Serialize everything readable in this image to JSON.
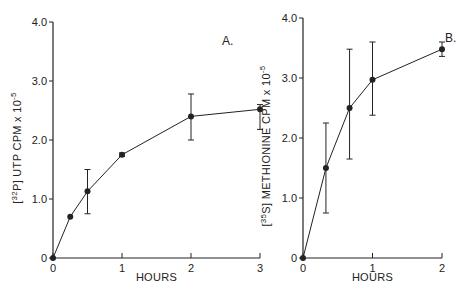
{
  "chart_data": [
    {
      "type": "line",
      "panel_label": "A.",
      "title": "",
      "xlabel": "HOURS",
      "ylabel_prefix": "[32P]",
      "ylabel_isotope_mass": "32",
      "ylabel_isotope_symbol": "P",
      "ylabel": "UTP CPM x 10",
      "ylabel_exponent": "-5",
      "ylabel_full": "[32P] UTP CPM x 10^-5",
      "xlim": [
        0,
        3
      ],
      "ylim": [
        0,
        4.0
      ],
      "x_ticks": [
        "0",
        "1",
        "2",
        "3"
      ],
      "y_ticks": [
        "0",
        "1.0",
        "2.0",
        "3.0",
        "4.0"
      ],
      "grid": false,
      "series": [
        {
          "name": "UTP incorporation",
          "x": [
            0,
            0.25,
            0.5,
            1,
            2,
            3
          ],
          "y": [
            0,
            0.7,
            1.13,
            1.75,
            2.4,
            2.52
          ],
          "err_low": [
            0,
            0.7,
            0.75,
            1.72,
            2.0,
            2.18
          ],
          "err_high": [
            0,
            0.7,
            1.5,
            1.78,
            2.78,
            2.6
          ]
        }
      ]
    },
    {
      "type": "line",
      "panel_label": "B.",
      "title": "",
      "xlabel": "HOURS",
      "ylabel_prefix": "[35S]",
      "ylabel_isotope_mass": "35",
      "ylabel_isotope_symbol": "S",
      "ylabel": "METHIONINE CPM x 10",
      "ylabel_exponent": "-5",
      "ylabel_full": "[35S] METHIONINE CPM x 10^-5",
      "xlim": [
        0,
        2
      ],
      "ylim": [
        0,
        4.0
      ],
      "x_ticks": [
        "0",
        "1",
        "2"
      ],
      "y_ticks": [
        "0",
        "1.0",
        "2.0",
        "3.0",
        "4.0"
      ],
      "grid": false,
      "series": [
        {
          "name": "Methionine incorporation",
          "x": [
            0,
            0.33,
            0.67,
            1,
            2
          ],
          "y": [
            0,
            1.5,
            2.5,
            2.97,
            3.48
          ],
          "err_low": [
            0,
            0.75,
            1.65,
            2.38,
            3.36
          ],
          "err_high": [
            0,
            2.25,
            3.48,
            3.6,
            3.6
          ]
        }
      ]
    }
  ],
  "colors": {
    "ink": "#222222",
    "background": "#ffffff"
  }
}
